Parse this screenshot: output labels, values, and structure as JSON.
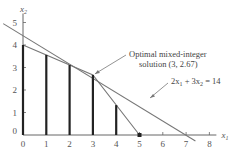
{
  "chart_data": {
    "type": "line",
    "title": "",
    "xlabel": "x1",
    "ylabel": "x2",
    "xlim": [
      0,
      8.3
    ],
    "ylim": [
      0,
      5.3
    ],
    "x_ticks": [
      "0",
      "1",
      "2",
      "3",
      "4",
      "5",
      "6",
      "7",
      "8"
    ],
    "y_ticks": [
      "0",
      "1",
      "2",
      "3",
      "4",
      "5"
    ],
    "grid": false,
    "series": [
      {
        "name": "2x1 + 3x2 = 14",
        "points": [
          [
            -0.85,
            4.95
          ],
          [
            7.4,
            -0.27
          ]
        ]
      },
      {
        "name": "mixed-integer boundary",
        "points": [
          [
            0,
            4
          ],
          [
            3,
            2.67
          ],
          [
            5,
            0
          ]
        ]
      }
    ],
    "vertical_bars": [
      {
        "x": 0,
        "top": 4.0
      },
      {
        "x": 1,
        "top": 3.56
      },
      {
        "x": 2,
        "top": 3.11
      },
      {
        "x": 3,
        "top": 2.67
      },
      {
        "x": 4,
        "top": 1.33
      }
    ],
    "points": [
      {
        "x": 5,
        "y": 0
      }
    ],
    "annotations": [
      {
        "text_line1": "Optimal mixed-integer",
        "text_line2": "solution (3, 2.67)",
        "points_to": [
          3,
          2.67
        ]
      },
      {
        "text": "2x1 + 3x2 = 14",
        "points_to": [
          5.5,
          1.0
        ]
      }
    ]
  },
  "labels": {
    "x_axis": "x",
    "x_axis_sub": "1",
    "y_axis": "x",
    "y_axis_sub": "2",
    "annot1_line1": "Optimal mixed-integer",
    "annot1_line2": "solution (3, 2.67)",
    "annot2_a": "2x",
    "annot2_a_sub": "1",
    "annot2_b": " + 3x",
    "annot2_b_sub": "2",
    "annot2_c": " = 14"
  },
  "colors": {
    "axis": "#666666",
    "line": "#777777",
    "bars": "#222222"
  }
}
